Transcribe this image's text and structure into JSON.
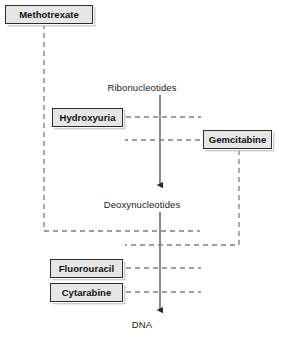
{
  "diagram": {
    "colors": {
      "box_fill": "#e6e6e6",
      "box_border": "#2b2b2b",
      "box_shadow": "#9a9a9a",
      "arrow": "#6b6b6b",
      "inhibition_line": "#7a7a7a",
      "text": "#1a1a1a",
      "background": "#ffffff"
    },
    "pathway_nodes": [
      {
        "id": "ribonucleotides",
        "label": "Ribonucleotides",
        "x": 160,
        "y": 88
      },
      {
        "id": "deoxynucleotides",
        "label": "Deoxynucleotides",
        "x": 160,
        "y": 205
      },
      {
        "id": "dna",
        "label": "DNA",
        "x": 160,
        "y": 325
      }
    ],
    "pathway_arrows": [
      {
        "id": "ribo-to-deoxy",
        "from": "ribonucleotides",
        "to": "deoxynucleotides"
      },
      {
        "id": "deoxy-to-dna",
        "from": "deoxynucleotides",
        "to": "dna"
      }
    ],
    "drugs": [
      {
        "id": "methotrexate",
        "label": "Methotrexate",
        "x": 5,
        "y": 5,
        "w": 88,
        "h": 19,
        "targets": "deoxynucleotides"
      },
      {
        "id": "hydroxyuria",
        "label": "Hydroxyuria",
        "x": 52,
        "y": 108,
        "w": 71,
        "h": 19,
        "targets": "ribonucleotides"
      },
      {
        "id": "gemcitabine",
        "label": "Gemcitabine",
        "x": 203,
        "y": 130,
        "w": 69,
        "h": 19,
        "targets": "ribonucleotides"
      },
      {
        "id": "fluorouracil",
        "label": "Fluorouracil",
        "x": 50,
        "y": 259,
        "w": 73,
        "h": 19,
        "targets": "dna"
      },
      {
        "id": "cytarabine",
        "label": "Cytarabine",
        "x": 50,
        "y": 283,
        "w": 73,
        "h": 19,
        "targets": "dna"
      }
    ],
    "inhibition_links": [
      {
        "id": "hydroxyuria-inhibition",
        "drug": "hydroxyuria",
        "style": "dashed"
      },
      {
        "id": "gemcitabine-inhibition",
        "drug": "gemcitabine",
        "style": "dashed"
      },
      {
        "id": "methotrexate-inhibition",
        "drug": "methotrexate",
        "style": "dashed"
      },
      {
        "id": "fluorouracil-inhibition",
        "drug": "fluorouracil",
        "style": "dashed"
      },
      {
        "id": "cytarabine-inhibition",
        "drug": "cytarabine",
        "style": "dashed"
      }
    ]
  }
}
